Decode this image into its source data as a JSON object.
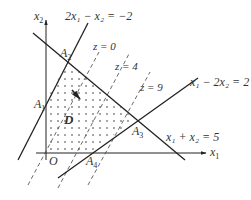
{
  "diagram": {
    "colors": {
      "line": "#222222",
      "dash": "#444444",
      "dots": "#333333",
      "text": "#333333"
    },
    "axes": {
      "x_label": "x",
      "x_sub": "1",
      "y_label": "x",
      "y_sub": "2",
      "origin_label": "O"
    },
    "constraints": [
      {
        "id": "c1",
        "label": "2x₁ − x₂ = −2"
      },
      {
        "id": "c2",
        "label": "x₁ − 2x₂ = 2"
      },
      {
        "id": "c3",
        "label": "x₁ + x₂ = 5"
      }
    ],
    "objective_levels": [
      {
        "id": "z0",
        "label": "z = 0"
      },
      {
        "id": "z4",
        "label": "z = 4"
      },
      {
        "id": "z9",
        "label": "z = 9"
      }
    ],
    "vertices": [
      {
        "id": "A1",
        "label": "A",
        "sub": "1"
      },
      {
        "id": "A2",
        "label": "A",
        "sub": "2"
      },
      {
        "id": "A3",
        "label": "A",
        "sub": "3"
      },
      {
        "id": "A4",
        "label": "A",
        "sub": "4"
      }
    ],
    "region_label": "D"
  }
}
